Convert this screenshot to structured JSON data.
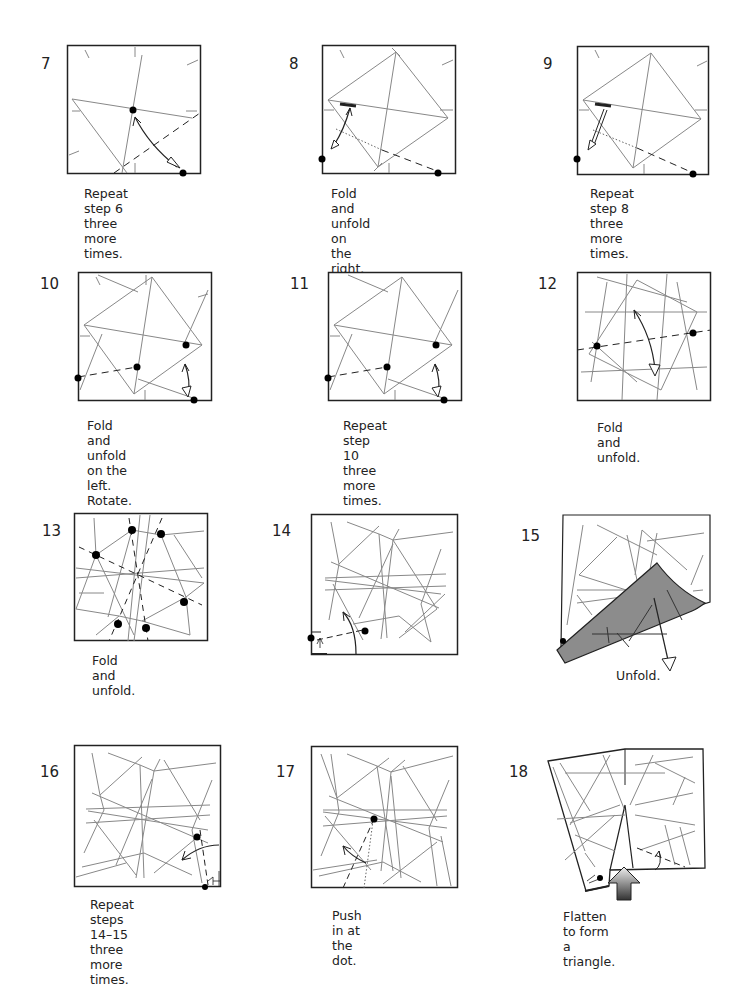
{
  "page": {
    "background": "#ffffff",
    "line_color": "#888888",
    "border_color": "#222222",
    "shade_color": "#8c8c8c"
  },
  "steps": [
    {
      "number": "7",
      "caption": "Repeat step 6\nthree more times.",
      "num_pos": [
        41,
        62
      ],
      "box": [
        67,
        45,
        133,
        128
      ],
      "cap_pos": [
        84,
        185
      ]
    },
    {
      "number": "8",
      "caption": "Fold and unfold on\nthe right. Rotate.",
      "num_pos": [
        289,
        62
      ],
      "box": [
        322,
        45,
        133,
        128
      ],
      "cap_pos": [
        331,
        185
      ]
    },
    {
      "number": "9",
      "caption": "Repeat step 8\nthree more times.",
      "num_pos": [
        543,
        62
      ],
      "box": [
        577,
        46,
        132,
        128
      ],
      "cap_pos": [
        590,
        185
      ]
    },
    {
      "number": "10",
      "caption": "Fold and unfold\non the left. Rotate.",
      "num_pos": [
        40,
        282
      ],
      "box": [
        78,
        272,
        133,
        128
      ],
      "cap_pos": [
        87,
        417
      ]
    },
    {
      "number": "11",
      "caption": "Repeat step 10\nthree more times.",
      "num_pos": [
        290,
        282
      ],
      "box": [
        328,
        272,
        133,
        128
      ],
      "cap_pos": [
        343,
        417
      ]
    },
    {
      "number": "12",
      "caption": "Fold and unfold.",
      "num_pos": [
        538,
        282
      ],
      "box": [
        577,
        272,
        133,
        128
      ],
      "cap_pos": [
        597,
        420
      ]
    },
    {
      "number": "13",
      "caption": "Fold and unfold.",
      "num_pos": [
        42,
        522
      ],
      "box": [
        74,
        513,
        134,
        128
      ],
      "cap_pos": [
        92,
        653
      ]
    },
    {
      "number": "14",
      "caption": "",
      "num_pos": [
        272,
        522
      ],
      "box": [
        311,
        514,
        146,
        140
      ],
      "cap_pos": [
        0,
        0
      ]
    },
    {
      "number": "15",
      "caption": "Unfold.",
      "num_pos": [
        521,
        527
      ],
      "box": [
        563,
        515,
        147,
        154
      ],
      "cap_pos": [
        616,
        667
      ]
    },
    {
      "number": "16",
      "caption": "Repeat steps 14–15\nthree more times.",
      "num_pos": [
        40,
        763
      ],
      "box": [
        74,
        745,
        147,
        142
      ],
      "cap_pos": [
        90,
        897
      ]
    },
    {
      "number": "17",
      "caption": "Push in at the dot.",
      "num_pos": [
        276,
        763
      ],
      "box": [
        311,
        746,
        147,
        142
      ],
      "cap_pos": [
        332,
        907
      ]
    },
    {
      "number": "18",
      "caption": "Flatten to form a triangle.",
      "num_pos": [
        509,
        763
      ],
      "box": [
        545,
        745,
        164,
        150
      ],
      "cap_pos": [
        563,
        908
      ]
    }
  ]
}
